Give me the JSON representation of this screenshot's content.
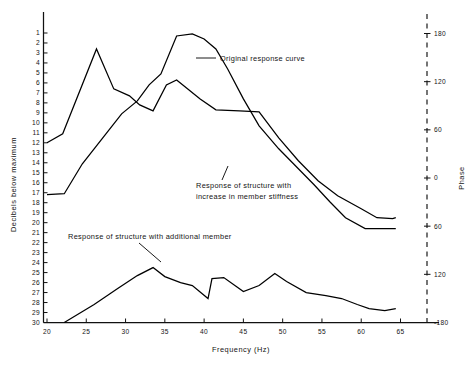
{
  "chart_data": {
    "type": "line",
    "title": "",
    "xlabel": "Frequency (Hz)",
    "ylabel": "Decibels below maximum",
    "ylabel_right": "Phase",
    "xlim": [
      18.5,
      66.5
    ],
    "ylim": [
      30,
      0.5
    ],
    "ylim_right": [
      -180,
      180
    ],
    "y_axis_inverted": true,
    "grid": false,
    "legend": "annotations-inline",
    "xticks": [
      20,
      25,
      30,
      35,
      40,
      45,
      50,
      55,
      60,
      65
    ],
    "yticks": [
      1,
      2,
      3,
      4,
      5,
      6,
      7,
      8,
      9,
      10,
      11,
      12,
      13,
      14,
      15,
      16,
      17,
      18,
      19,
      20,
      21,
      22,
      23,
      24,
      25,
      26,
      27,
      28,
      29,
      30
    ],
    "yticks_right": [
      180,
      120,
      60,
      0,
      -60,
      -120,
      -180
    ],
    "yticklabels_right": [
      "180",
      "120",
      "60",
      "0",
      "60",
      "120",
      "-180"
    ],
    "series": [
      {
        "name": "Original response curve",
        "x": [
          20,
          22,
          26.3,
          28.5,
          30.5,
          31.8,
          33.5,
          35.2,
          36.5,
          39.5,
          41.5,
          44.5,
          47,
          49.5,
          52,
          54.5,
          57,
          60,
          62,
          64,
          64.4
        ],
        "values": [
          12,
          11.1,
          2.6,
          6.6,
          7.3,
          8.2,
          8.8,
          6.2,
          5.7,
          7.6,
          8.7,
          8.8,
          8.9,
          11.5,
          13.8,
          15.8,
          17.3,
          18.6,
          19.5,
          19.6,
          19.5
        ]
      },
      {
        "name": "Response of structure with increase in member stiffness",
        "x": [
          20,
          22.2,
          24.5,
          27,
          29.5,
          31.5,
          33,
          34.5,
          36.5,
          38.5,
          40,
          41.5,
          43,
          45,
          47,
          49.5,
          52,
          54,
          56,
          58,
          60.5,
          62.5,
          64.4
        ],
        "values": [
          17.2,
          17.1,
          14.1,
          11.6,
          9.1,
          7.8,
          6.2,
          5.1,
          1.3,
          1.1,
          1.6,
          2.6,
          4.6,
          7.6,
          10.3,
          12.6,
          14.6,
          16.2,
          17.9,
          19.5,
          20.6,
          20.6,
          20.6
        ]
      },
      {
        "name": "Response of structure with additional member",
        "x": [
          22.2,
          26,
          29,
          31.5,
          33.5,
          35,
          37,
          38.5,
          40.5,
          41,
          42.5,
          45,
          47,
          49,
          50.5,
          53,
          55.5,
          57.5,
          59.5,
          61,
          63,
          64.4
        ],
        "values": [
          30,
          28.2,
          26.6,
          25.3,
          24.5,
          25.4,
          26.0,
          26.3,
          27.6,
          25.6,
          25.5,
          26.9,
          26.3,
          25.1,
          25.9,
          27.0,
          27.3,
          27.6,
          28.2,
          28.6,
          28.8,
          28.6
        ]
      }
    ],
    "annotations": [
      {
        "text_line1": "Original response curve",
        "text_line2": "",
        "x": 39.2,
        "y": 4.4
      },
      {
        "text_line1": "Response of structure with",
        "text_line2": "increase in member stiffness",
        "x": 37.5,
        "y": 17.8
      },
      {
        "text_line1": "Response of structure with additional member",
        "text_line2": "",
        "x": 25.0,
        "y": 23.2
      }
    ]
  },
  "axes": {
    "x_title": "Frequency (Hz)",
    "y_left_title": "Decibels below maximum",
    "y_right_title": "Phase",
    "x_tick_labels": [
      "20",
      "25",
      "30",
      "35",
      "40",
      "45",
      "50",
      "55",
      "60",
      "65"
    ],
    "y_left_tick_labels": [
      "1",
      "2",
      "3",
      "4",
      "5",
      "6",
      "7",
      "8",
      "9",
      "10",
      "11",
      "12",
      "13",
      "14",
      "15",
      "16",
      "17",
      "18",
      "19",
      "20",
      "21",
      "22",
      "23",
      "24",
      "25",
      "26",
      "27",
      "28",
      "29",
      "30"
    ],
    "y_right_tick_labels": [
      "180",
      "120",
      "60",
      "0",
      "60",
      "120",
      "-180"
    ]
  },
  "annotations": {
    "original_curve": "Original response curve",
    "stiffness_line1": "Response of structure with",
    "stiffness_line2": "increase in member stiffness",
    "additional_member": "Response of structure with additional member"
  },
  "colors": {
    "ink": "#000000",
    "background": "#ffffff"
  }
}
